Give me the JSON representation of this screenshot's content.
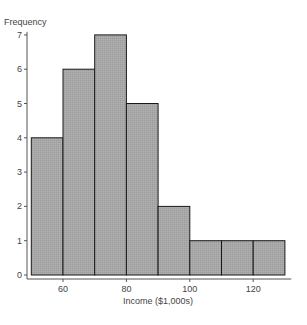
{
  "chart_data": {
    "type": "bar",
    "subtype": "histogram",
    "title": "",
    "xlabel": "Income ($1,000s)",
    "ylabel": "Frequency",
    "bin_edges": [
      50,
      60,
      70,
      80,
      90,
      100,
      110,
      120,
      130
    ],
    "categories": [
      "50-60",
      "60-70",
      "70-80",
      "80-90",
      "90-100",
      "100-110",
      "110-120",
      "120-130"
    ],
    "values": [
      4,
      6,
      7,
      5,
      2,
      1,
      1,
      1
    ],
    "xlim": [
      47,
      132
    ],
    "ylim": [
      0,
      7
    ],
    "x_ticks": [
      60,
      80,
      100,
      120
    ],
    "y_ticks": [
      0,
      1,
      2,
      3,
      4,
      5,
      6,
      7
    ],
    "grid": false,
    "legend": null,
    "colors": {
      "bar_fill": "#a6a6a6",
      "bar_edge": "#1a1a1a",
      "axis": "#555555",
      "text": "#444444"
    }
  }
}
